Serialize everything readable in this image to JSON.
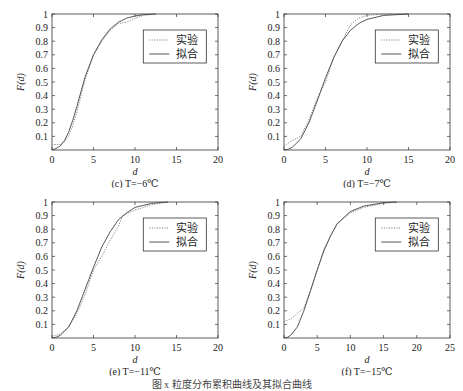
{
  "figure": {
    "caption": "图 x  粒度分布累积曲线及其拟合曲线"
  },
  "legend": {
    "experimental": "实验",
    "fitted": "拟合"
  },
  "chart_data": [
    {
      "type": "line",
      "panel": "c",
      "subcaption": "(c) T=−6℃",
      "xlabel": "d",
      "ylabel": "F(d)",
      "xlim": [
        0,
        20
      ],
      "ylim": [
        0,
        1
      ],
      "xticks": [
        0,
        5,
        10,
        15,
        20
      ],
      "yticks": [
        0.1,
        0.2,
        0.3,
        0.4,
        0.5,
        0.6,
        0.7,
        0.8,
        0.9,
        1
      ],
      "legend_position": "upper right",
      "grid": false,
      "series": [
        {
          "name": "实验",
          "style": "dotted",
          "x": [
            0,
            0.5,
            1,
            1.5,
            2,
            2.5,
            3,
            3.5,
            4,
            5,
            6,
            7,
            8,
            9,
            10,
            11,
            12.5
          ],
          "y": [
            0.04,
            0.04,
            0.04,
            0.06,
            0.1,
            0.18,
            0.28,
            0.4,
            0.52,
            0.7,
            0.8,
            0.88,
            0.93,
            0.94,
            0.97,
            0.99,
            1.0
          ]
        },
        {
          "name": "拟合",
          "style": "solid",
          "x": [
            0,
            0.5,
            1,
            1.5,
            2,
            2.5,
            3,
            3.5,
            4,
            5,
            6,
            7,
            8,
            9,
            10,
            11,
            12.5
          ],
          "y": [
            0.0,
            0.01,
            0.03,
            0.07,
            0.13,
            0.22,
            0.32,
            0.43,
            0.54,
            0.7,
            0.81,
            0.89,
            0.94,
            0.97,
            0.985,
            0.995,
            1.0
          ]
        }
      ]
    },
    {
      "type": "line",
      "panel": "d",
      "subcaption": "(d) T=−7℃",
      "xlabel": "d",
      "ylabel": "F(d)",
      "xlim": [
        0,
        20
      ],
      "ylim": [
        0,
        1
      ],
      "xticks": [
        0,
        5,
        10,
        15,
        20
      ],
      "yticks": [
        0.1,
        0.2,
        0.3,
        0.4,
        0.5,
        0.6,
        0.7,
        0.8,
        0.9,
        1
      ],
      "legend_position": "upper right",
      "grid": false,
      "series": [
        {
          "name": "实验",
          "style": "dotted",
          "x": [
            0,
            0.5,
            1,
            2,
            3,
            4,
            4.5,
            5,
            6,
            7,
            8,
            9,
            10,
            12,
            15
          ],
          "y": [
            0.03,
            0.05,
            0.07,
            0.1,
            0.22,
            0.38,
            0.44,
            0.5,
            0.68,
            0.8,
            0.92,
            0.97,
            0.99,
            1.0,
            1.0
          ]
        },
        {
          "name": "拟合",
          "style": "solid",
          "x": [
            0,
            0.5,
            1,
            2,
            3,
            4,
            5,
            6,
            7,
            8,
            9,
            10,
            12,
            15
          ],
          "y": [
            0.0,
            0.005,
            0.02,
            0.08,
            0.2,
            0.36,
            0.53,
            0.68,
            0.8,
            0.88,
            0.93,
            0.96,
            0.99,
            1.0
          ]
        }
      ]
    },
    {
      "type": "line",
      "panel": "e",
      "subcaption": "(e) T=−11℃",
      "xlabel": "d",
      "ylabel": "F(d)",
      "xlim": [
        0,
        20
      ],
      "ylim": [
        0,
        1
      ],
      "xticks": [
        0,
        5,
        10,
        15,
        20
      ],
      "yticks": [
        0.1,
        0.2,
        0.3,
        0.4,
        0.5,
        0.6,
        0.7,
        0.8,
        0.9,
        1
      ],
      "legend_position": "upper right",
      "grid": false,
      "series": [
        {
          "name": "实验",
          "style": "dotted",
          "x": [
            0,
            0.5,
            1,
            2,
            3,
            4,
            5,
            6,
            7,
            8,
            8.5,
            10,
            12,
            14
          ],
          "y": [
            0.01,
            0.02,
            0.03,
            0.08,
            0.18,
            0.32,
            0.5,
            0.6,
            0.72,
            0.82,
            0.9,
            0.94,
            0.98,
            1.0
          ]
        },
        {
          "name": "拟合",
          "style": "solid",
          "x": [
            0,
            0.5,
            1,
            2,
            3,
            4,
            5,
            6,
            7,
            8,
            9,
            10,
            12,
            14
          ],
          "y": [
            0.0,
            0.005,
            0.02,
            0.08,
            0.2,
            0.36,
            0.52,
            0.67,
            0.78,
            0.87,
            0.92,
            0.96,
            0.99,
            1.0
          ]
        }
      ]
    },
    {
      "type": "line",
      "panel": "f",
      "subcaption": "(f) T=−15℃",
      "xlabel": "d",
      "ylabel": "F(d)",
      "xlim": [
        0,
        25
      ],
      "ylim": [
        0,
        1
      ],
      "xticks": [
        0,
        5,
        10,
        15,
        20,
        25
      ],
      "yticks": [
        0.1,
        0.2,
        0.3,
        0.4,
        0.5,
        0.6,
        0.7,
        0.8,
        0.9,
        1
      ],
      "legend_position": "upper right",
      "grid": false,
      "series": [
        {
          "name": "实验",
          "style": "dotted",
          "x": [
            0,
            0.5,
            1,
            2,
            3,
            4,
            5,
            6,
            7,
            8,
            10,
            12,
            15,
            17
          ],
          "y": [
            0.12,
            0.13,
            0.14,
            0.18,
            0.22,
            0.35,
            0.5,
            0.65,
            0.75,
            0.84,
            0.92,
            0.96,
            0.99,
            1.0
          ]
        },
        {
          "name": "拟合",
          "style": "solid",
          "x": [
            0,
            0.5,
            1,
            2,
            3,
            4,
            5,
            6,
            7,
            8,
            10,
            12,
            15,
            17
          ],
          "y": [
            0.0,
            0.005,
            0.02,
            0.08,
            0.2,
            0.35,
            0.5,
            0.64,
            0.75,
            0.84,
            0.93,
            0.97,
            0.995,
            1.0
          ]
        }
      ]
    }
  ]
}
